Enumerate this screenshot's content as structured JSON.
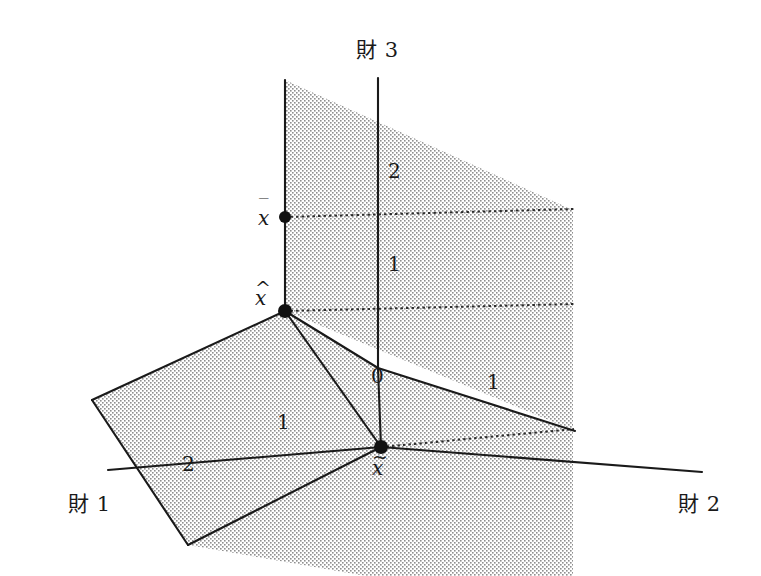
{
  "figure": {
    "kind": "3d-axonometric-diagram",
    "background_color": "#ffffff",
    "line_color": "#1a1a1a",
    "shade_color": "#b8b8b8"
  },
  "axes": [
    {
      "id": "good1",
      "label": "財 1",
      "x": 68,
      "y": 505
    },
    {
      "id": "good2",
      "label": "財 2",
      "x": 678,
      "y": 505
    },
    {
      "id": "good3",
      "label": "財 3",
      "x": 356,
      "y": 46
    }
  ],
  "origin": {
    "label": "0",
    "x": 371,
    "y": 366
  },
  "ticks": [
    {
      "axis": "good3",
      "label": "2",
      "x": 388,
      "y": 161
    },
    {
      "axis": "good3",
      "label": "1",
      "x": 388,
      "y": 254
    },
    {
      "axis": "good2",
      "label": "1",
      "x": 487,
      "y": 372
    },
    {
      "axis": "good1",
      "label": "1",
      "x": 277,
      "y": 412
    },
    {
      "axis": "good1",
      "label": "2",
      "x": 182,
      "y": 454
    }
  ],
  "points": [
    {
      "id": "x-bar",
      "base": "x",
      "mark": "‾",
      "accent": "bar",
      "px": 285,
      "py": 217,
      "lx": 258,
      "ly": 208
    },
    {
      "id": "x-hat",
      "base": "x",
      "mark": "^",
      "accent": "hat",
      "px": 285,
      "py": 311,
      "lx": 255,
      "ly": 288
    },
    {
      "id": "x-tilde",
      "base": "x",
      "mark": "~",
      "accent": "tilde",
      "px": 381,
      "py": 447,
      "lx": 372,
      "ly": 458
    }
  ],
  "geometry": {
    "vertical_plane": "285,80 573,210 573,430 285,311",
    "tilted_plane": "92,400 285,311 381,447 188,545",
    "floor_plane_right": "381,447 573,430 573,566 381,566",
    "axis_good3": "378,78 378,368",
    "axis_good2": "381,447 700,470",
    "axis_good1": "381,447 110,470",
    "edge_origin_left": "378,368 285,311",
    "edge_origin_right": "378,368 573,430",
    "edge_origin_down": "378,368 381,447",
    "dotted_xbar": "285,217 573,210",
    "dotted_xhat": "285,311 573,305",
    "dotted_xtilde": "381,447 573,430"
  }
}
